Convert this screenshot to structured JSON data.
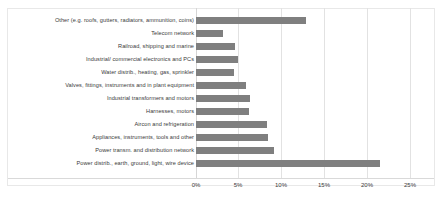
{
  "chart_data": {
    "type": "bar",
    "orientation": "horizontal",
    "title": "",
    "xlabel": "",
    "ylabel": "",
    "xlim": [
      0,
      25
    ],
    "xtick_labels": [
      "0%",
      "5%",
      "10%",
      "15%",
      "20%",
      "25%"
    ],
    "xtick_values": [
      0,
      5,
      10,
      15,
      20,
      25
    ],
    "grid": true,
    "legend": "none",
    "bar_color": "#7f7f7f",
    "categories": [
      "Other (e.g. roofs, gutters, radiators, ammunition, coins)",
      "Telecom network",
      "Railroad, shipping and marine",
      "Industrial/ commercial electronics and PCs",
      "Water distrib., heating, gas, sprinkler",
      "Valves, fittings, instruments and in plant equipment",
      "Industrial transformers and motors",
      "Harnesses, motors",
      "Aircon and refrigeration",
      "Appliances, instruments, tools and other",
      "Power transm. and distribution network",
      "Power distrib., earth, ground, light, wire device"
    ],
    "values": [
      12.8,
      3.2,
      4.6,
      4.9,
      4.4,
      5.8,
      6.3,
      6.2,
      8.3,
      8.4,
      9.1,
      21.5
    ]
  }
}
